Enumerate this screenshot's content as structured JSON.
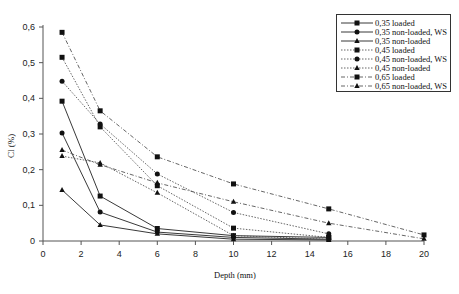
{
  "chart_data": {
    "type": "line",
    "title": "",
    "xlabel": "Depth (mm)",
    "ylabel": "Cl (%)",
    "xlim": [
      0,
      20
    ],
    "ylim": [
      0,
      0.6
    ],
    "x_ticks": [
      "0",
      "2",
      "4",
      "6",
      "8",
      "10",
      "12",
      "14",
      "16",
      "18",
      "20"
    ],
    "y_ticks": [
      "0",
      "0,1",
      "0,2",
      "0,3",
      "0,4",
      "0,5",
      "0,6"
    ],
    "grid": false,
    "legend_position": "upper right",
    "series": [
      {
        "name": "0,35 loaded",
        "marker": "square",
        "style": "solid",
        "x": [
          1,
          3,
          6,
          10,
          15
        ],
        "values": [
          0.392,
          0.126,
          0.035,
          0.015,
          0.01
        ]
      },
      {
        "name": "0,35 non-loaded, WS",
        "marker": "circle",
        "style": "solid",
        "x": [
          1,
          3,
          6,
          10,
          15
        ],
        "values": [
          0.303,
          0.081,
          0.025,
          0.01,
          0.005
        ]
      },
      {
        "name": "0,35 non-loaded",
        "marker": "triangle",
        "style": "solid",
        "x": [
          1,
          3,
          6,
          10,
          15
        ],
        "values": [
          0.143,
          0.045,
          0.02,
          0.005,
          0.003
        ]
      },
      {
        "name": "0,45 loaded",
        "marker": "square",
        "style": "dotted",
        "x": [
          1,
          3,
          6,
          10,
          15
        ],
        "values": [
          0.515,
          0.32,
          0.155,
          0.036,
          0.01
        ]
      },
      {
        "name": "0,45 non-loaded, WS",
        "marker": "circle",
        "style": "dotted",
        "x": [
          1,
          3,
          6,
          10,
          15
        ],
        "values": [
          0.448,
          0.328,
          0.188,
          0.08,
          0.02
        ]
      },
      {
        "name": "0,45 non-loaded",
        "marker": "triangle",
        "style": "dotted",
        "x": [
          1,
          3,
          6,
          10,
          15
        ],
        "values": [
          0.238,
          0.219,
          0.135,
          0.015,
          0.005
        ]
      },
      {
        "name": "0,65 loaded",
        "marker": "square",
        "style": "dashdot",
        "x": [
          1,
          3,
          6,
          10,
          15,
          20
        ],
        "values": [
          0.585,
          0.365,
          0.236,
          0.16,
          0.09,
          0.017
        ]
      },
      {
        "name": "0,65 non-loaded, WS",
        "marker": "triangle",
        "style": "dashdot",
        "x": [
          1,
          3,
          6,
          10,
          15,
          20
        ],
        "values": [
          0.255,
          0.214,
          0.163,
          0.11,
          0.05,
          0.006
        ]
      }
    ]
  },
  "axes": {
    "x_label": "Depth (mm)",
    "y_label": "Cl (%)"
  },
  "legend": {
    "items": [
      {
        "label": "0,35 loaded"
      },
      {
        "label": "0,35 non-loaded, WS"
      },
      {
        "label": "0,35 non-loaded"
      },
      {
        "label": "0,45 loaded"
      },
      {
        "label": "0,45 non-loaded, WS"
      },
      {
        "label": "0,45 non-loaded"
      },
      {
        "label": "0,65 loaded"
      },
      {
        "label": "0,65 non-loaded, WS"
      }
    ]
  }
}
